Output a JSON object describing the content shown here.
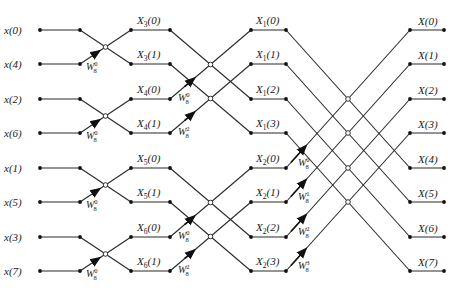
{
  "rows_y": [
    30,
    64,
    99,
    133,
    168,
    202,
    237,
    271
  ],
  "columns_x": {
    "in_dot": 40,
    "s1_in": 80,
    "s1_out": 131,
    "s2_in": 170,
    "s2_out": 251,
    "s3_in": 286,
    "s3_out": 410,
    "out_end": 444
  },
  "inputs": [
    "x(0)",
    "x(4)",
    "x(2)",
    "x(6)",
    "x(1)",
    "x(5)",
    "x(3)",
    "x(7)"
  ],
  "stage1_outputs": [
    {
      "name": "X",
      "sub": "3",
      "arg": "(0)"
    },
    {
      "name": "X",
      "sub": "3",
      "arg": "(1)"
    },
    {
      "name": "X",
      "sub": "4",
      "arg": "(0)"
    },
    {
      "name": "X",
      "sub": "4",
      "arg": "(1)"
    },
    {
      "name": "X",
      "sub": "5",
      "arg": "(0)"
    },
    {
      "name": "X",
      "sub": "5",
      "arg": "(1)"
    },
    {
      "name": "X",
      "sub": "6",
      "arg": "(0)"
    },
    {
      "name": "X",
      "sub": "6",
      "arg": "(1)"
    }
  ],
  "stage2_outputs": [
    {
      "name": "X",
      "sub": "1",
      "arg": "(0)"
    },
    {
      "name": "X",
      "sub": "1",
      "arg": "(1)"
    },
    {
      "name": "X",
      "sub": "1",
      "arg": "(2)"
    },
    {
      "name": "X",
      "sub": "1",
      "arg": "(3)"
    },
    {
      "name": "X",
      "sub": "2",
      "arg": "(0)"
    },
    {
      "name": "X",
      "sub": "2",
      "arg": "(1)"
    },
    {
      "name": "X",
      "sub": "2",
      "arg": "(2)"
    },
    {
      "name": "X",
      "sub": "2",
      "arg": "(3)"
    }
  ],
  "outputs": [
    "X(0)",
    "X(1)",
    "X(2)",
    "X(3)",
    "X(4)",
    "X(5)",
    "X(6)",
    "X(7)"
  ],
  "twiddles": {
    "stage1": [
      {
        "row": 1,
        "base": "W",
        "sub": "8",
        "exp": "0"
      },
      {
        "row": 3,
        "base": "W",
        "sub": "8",
        "exp": "0"
      },
      {
        "row": 5,
        "base": "W",
        "sub": "8",
        "exp": "0"
      },
      {
        "row": 7,
        "base": "W",
        "sub": "8",
        "exp": "0"
      }
    ],
    "stage2": [
      {
        "row": 2,
        "base": "W",
        "sub": "8",
        "exp": "0"
      },
      {
        "row": 3,
        "base": "W",
        "sub": "8",
        "exp": "2"
      },
      {
        "row": 6,
        "base": "W",
        "sub": "8",
        "exp": "0"
      },
      {
        "row": 7,
        "base": "W",
        "sub": "8",
        "exp": "2"
      }
    ],
    "stage3": [
      {
        "row": 4,
        "base": "W",
        "sub": "8",
        "exp": "0"
      },
      {
        "row": 5,
        "base": "W",
        "sub": "8",
        "exp": "1"
      },
      {
        "row": 6,
        "base": "W",
        "sub": "8",
        "exp": "2"
      },
      {
        "row": 7,
        "base": "W",
        "sub": "8",
        "exp": "3"
      }
    ]
  }
}
